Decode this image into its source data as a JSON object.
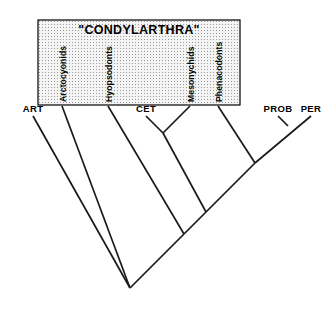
{
  "figure": {
    "kind": "cladogram",
    "width": 331,
    "height": 324,
    "background_color": "#ffffff",
    "line_color": "#1a1a1a"
  },
  "group_box": {
    "title": "\"CONDYLARTHRA\"",
    "fill_color": "#f2f2f2",
    "stipple_dot_color": "#9a9a9a",
    "border_color": "#000000",
    "x": 38,
    "y": 20,
    "width": 202,
    "height": 85
  },
  "inbox_taxa": [
    {
      "label": "Arctocyonids",
      "label_x": 62,
      "tip_x": 62
    },
    {
      "label": "Hyopsodonts",
      "label_x": 108,
      "tip_x": 108
    },
    {
      "label": "Mesonychids",
      "label_x": 190,
      "tip_x": 190
    },
    {
      "label": "Phenacodonts",
      "label_x": 218,
      "tip_x": 218
    }
  ],
  "outside_taxa": [
    {
      "label": "ART",
      "label_x": 33,
      "tip_x": 33
    },
    {
      "label": "CET",
      "label_x": 146,
      "tip_x": 146
    },
    {
      "label": "PROB",
      "label_x": 278,
      "tip_x": 278
    },
    {
      "label": "PER",
      "label_x": 311,
      "tip_x": 311
    }
  ],
  "chart_data": {
    "type": "cladogram",
    "title": "\"CONDYLARTHRA\"",
    "tip_order": [
      "ART",
      "Arctocyonids",
      "Hyopsodonts",
      "CET",
      "Mesonychids",
      "Phenacodonts",
      "PROB",
      "PER"
    ],
    "tips": [
      {
        "name": "ART",
        "x": 33,
        "y": 113,
        "in_group_box": false
      },
      {
        "name": "Arctocyonids",
        "x": 62,
        "y": 105,
        "in_group_box": true
      },
      {
        "name": "Hyopsodonts",
        "x": 108,
        "y": 105,
        "in_group_box": true
      },
      {
        "name": "CET",
        "x": 146,
        "y": 113,
        "in_group_box": false
      },
      {
        "name": "Mesonychids",
        "x": 190,
        "y": 105,
        "in_group_box": true
      },
      {
        "name": "Phenacodonts",
        "x": 218,
        "y": 105,
        "in_group_box": true
      },
      {
        "name": "PROB",
        "x": 278,
        "y": 113,
        "in_group_box": false
      },
      {
        "name": "PER",
        "x": 311,
        "y": 113,
        "in_group_box": false
      }
    ],
    "nodes": [
      {
        "id": "n_cet_meso",
        "x": 163,
        "y": 133,
        "children": [
          "CET",
          "Mesonychids"
        ]
      },
      {
        "id": "n_prob_per",
        "x": 288,
        "y": 126,
        "children": [
          "PROB",
          "PER"
        ]
      },
      {
        "id": "n4",
        "x": 255,
        "y": 163,
        "children": [
          "Phenacodonts",
          "n_prob_per"
        ]
      },
      {
        "id": "n3",
        "x": 206,
        "y": 212,
        "children": [
          "n_cet_meso",
          "n4"
        ]
      },
      {
        "id": "n2",
        "x": 184,
        "y": 234,
        "children": [
          "Hyopsodonts",
          "n3"
        ]
      },
      {
        "id": "n1",
        "x": 130,
        "y": 288,
        "children": [
          "Arctocyonids",
          "n2"
        ]
      },
      {
        "id": "root",
        "x": 130,
        "y": 288,
        "children": [
          "ART",
          "n1"
        ]
      }
    ],
    "branch_style": "diagonal-v",
    "grid": false,
    "legend": null
  }
}
